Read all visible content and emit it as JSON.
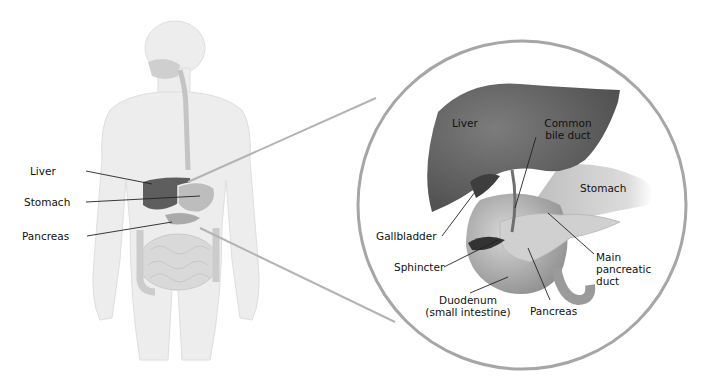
{
  "diagram": {
    "body_labels": {
      "liver": "Liver",
      "stomach": "Stomach",
      "pancreas": "Pancreas"
    },
    "detail_labels": {
      "liver": "Liver",
      "common_bile_duct_1": "Common",
      "common_bile_duct_2": "bile duct",
      "stomach": "Stomach",
      "gallbladder": "Gallbladder",
      "sphincter": "Sphincter",
      "main_pancreatic_duct_1": "Main",
      "main_pancreatic_duct_2": "pancreatic",
      "main_pancreatic_duct_3": "duct",
      "duodenum_1": "Duodenum",
      "duodenum_2": "(small intestine)",
      "pancreas": "Pancreas"
    },
    "colors": {
      "body": "#ececec",
      "body_outline": "#d6d6d6",
      "organ_dark": "#5a5a5a",
      "organ_mid": "#a8a8a8",
      "circle": "#a6a6a6",
      "leader": "#222222"
    }
  }
}
